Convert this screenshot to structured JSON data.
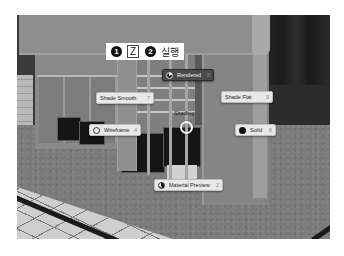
{
  "instructions": {
    "steps": [
      {
        "number": "1",
        "key": "Z"
      },
      {
        "number": "2",
        "text": "실행"
      }
    ]
  },
  "pie_menu": {
    "title": "Shading",
    "items": [
      {
        "id": "rendered",
        "label": "Rendered",
        "hotkey": "8",
        "icon": "rendered-sphere-icon",
        "highlighted": true
      },
      {
        "id": "shade-smooth",
        "label": "Shade Smooth",
        "hotkey": "7",
        "icon": null,
        "highlighted": false
      },
      {
        "id": "shade-flat",
        "label": "Shade Flat",
        "hotkey": "9",
        "icon": null,
        "highlighted": false
      },
      {
        "id": "wireframe",
        "label": "Wireframe",
        "hotkey": "4",
        "icon": "wireframe-sphere-icon",
        "highlighted": false
      },
      {
        "id": "solid",
        "label": "Solid",
        "hotkey": "6",
        "icon": "solid-sphere-icon",
        "highlighted": false
      },
      {
        "id": "material-preview",
        "label": "Material Preview",
        "hotkey": "2",
        "icon": "material-sphere-icon",
        "highlighted": false
      }
    ]
  },
  "colors": {
    "menu_item_bg": "#e8e8e8",
    "menu_item_active_bg": "#4a4a4a",
    "badge_bg": "#111111"
  }
}
